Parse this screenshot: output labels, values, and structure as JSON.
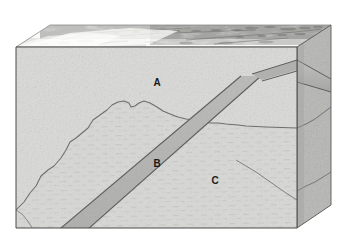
{
  "figure": {
    "type": "geologic-block-diagram",
    "background_color": "#ffffff",
    "width": 342,
    "height": 247
  },
  "labels": [
    {
      "id": "A",
      "text": "A",
      "x": 157,
      "y": 82,
      "description": "upper rock unit, stippled texture"
    },
    {
      "id": "B",
      "text": "B",
      "x": 157,
      "y": 163,
      "description": "lower rock unit, dashed texture"
    },
    {
      "id": "C",
      "text": "C",
      "x": 215,
      "y": 180,
      "description": "cross-cutting tabular dike"
    }
  ],
  "block": {
    "front_face": {
      "name": "front-face",
      "fill": "#dcdcda",
      "stroke": "#5a5a58",
      "points": "16,47 297,47 297,228 16,228"
    },
    "right_face": {
      "name": "right-face",
      "fill": "#b8b8b6",
      "stroke": "#5a5a58",
      "points": "297,47 331,25 331,205 297,228"
    },
    "top_face": {
      "name": "top-surface",
      "fill": "#f2f2f0",
      "stroke": "#8a8a88",
      "points": "16,47 50,25 331,25 297,47"
    }
  },
  "units": {
    "A": {
      "name": "unit-a",
      "label": "A",
      "fill": "#dcdcda",
      "texture": "fine-stipple"
    },
    "B": {
      "name": "unit-b",
      "label": "B",
      "fill": "#d6d6d4",
      "texture": "horizontal-dashes"
    },
    "C": {
      "name": "dike-c",
      "label": "C",
      "fill": "#b4b4b2",
      "texture": "massive",
      "stroke": "#585856"
    }
  },
  "contacts": {
    "a_b_contact_front": "16,210 24,202 30,193 36,186 41,176 48,170 54,166 61,158 66,150 70,142 76,138 82,133 88,128 93,120 100,115 107,110 112,105 118,102 124,101 129,103 131,107 135,106 139,103 144,101 150,103 157,107 163,111 170,114 178,117 186,119 194,120 202,122 210,123 218,123 226,124 238,125 246,126",
    "b_fracture_right": "253,160 262,166 272,172 281,179 289,186 297,193",
    "b_fracture_right2": "297,188 305,184 313,180 322,176 331,172"
  },
  "dike": {
    "front_band": "50,237 237,81 258,81 79,243",
    "right_band": "297,62 331,80 331,92 297,84",
    "apex_note": "dike crosses the front-right corner as a chevron"
  },
  "terrain": {
    "name": "top-terrain-relief",
    "description": "shaded-relief topography on top surface",
    "light_fill": "#f5f5f3",
    "ridge_color": "#6e6e6c"
  },
  "colors": {
    "outline": "#4a4a48",
    "front_fill": "#dcdcda",
    "side_fill": "#b8b8b6",
    "top_fill": "#f4f4f2",
    "dike_fill": "#b4b4b2",
    "label_text": "#1a1a1a"
  }
}
